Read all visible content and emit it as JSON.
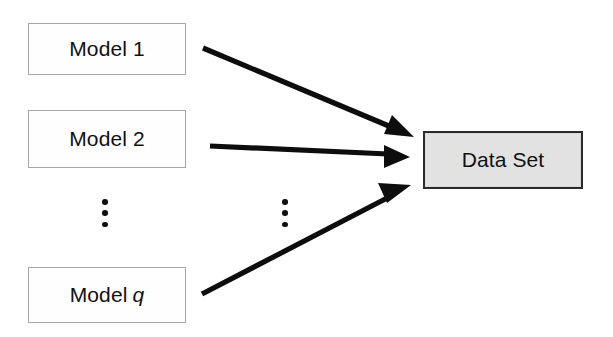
{
  "diagram": {
    "background_color": "#ffffff",
    "nodes": {
      "model_1": {
        "label": "Model 1",
        "fill": "#fefefe",
        "border": "#a6a6a6"
      },
      "model_2": {
        "label": "Model 2",
        "fill": "#fefefe",
        "border": "#a6a6a6"
      },
      "model_q": {
        "label_prefix": "Model",
        "label_variable": "q",
        "fill": "#fefefe",
        "border": "#a6a6a6"
      },
      "data_set": {
        "label": "Data Set",
        "fill": "#e2e2e2",
        "border": "#2a2a2a"
      }
    },
    "ellipsis": {
      "left": "⋮",
      "right": "⋮"
    },
    "arrows": [
      {
        "name": "model-1-to-data-set",
        "from": "Model 1",
        "to": "Data Set",
        "color": "#0d0d0d"
      },
      {
        "name": "model-2-to-data-set",
        "from": "Model 2",
        "to": "Data Set",
        "color": "#0d0d0d"
      },
      {
        "name": "model-q-to-data-set",
        "from": "Model q",
        "to": "Data Set",
        "color": "#0d0d0d"
      }
    ]
  }
}
